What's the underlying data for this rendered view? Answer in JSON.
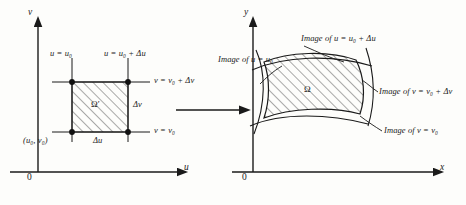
{
  "figure": {
    "background_color": "#fdfdfb",
    "ink_color": "#1a1a1a"
  },
  "left_plot": {
    "name": "uv-plane",
    "axis_y_label": "v",
    "axis_x_label": "u",
    "origin_label": "0",
    "region_label": "Ω′",
    "labels": {
      "left_edge": "u = u₀",
      "right_edge": "u = u₀ + Δu",
      "top_edge": "v = v₀ + Δv",
      "bottom_edge": "v = v₀",
      "corner_point": "(u₀, v₀)",
      "width_label": "Δu",
      "height_label": "Δv"
    },
    "corner_dots": 4,
    "hatched": true
  },
  "map_arrow": {
    "name": "mapping-arrow",
    "direction": "right",
    "label": ""
  },
  "right_plot": {
    "name": "xy-plane",
    "axis_y_label": "y",
    "axis_x_label": "x",
    "origin_label": "0",
    "region_label": "Ω",
    "labels": {
      "image_u0": "Image of u = u₀",
      "image_u0_du": "Image of u = u₀ + Δu",
      "image_v0_dv": "Image of v = v₀ + Δv",
      "image_v0": "Image of v = v₀"
    },
    "hatched": true
  }
}
